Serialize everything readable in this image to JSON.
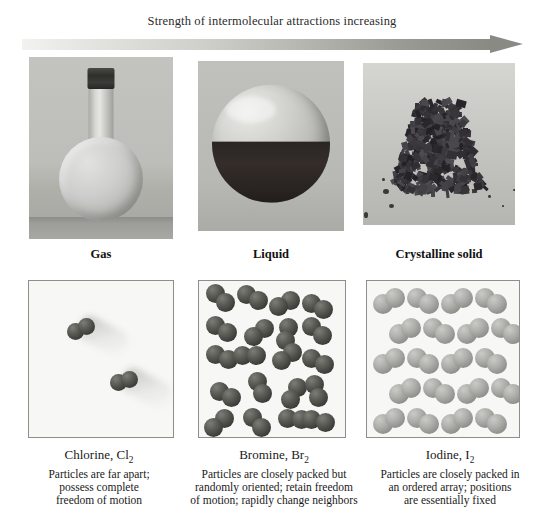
{
  "header": {
    "title": "Strength of intermolecular attractions increasing",
    "arrow": {
      "name": "gradient-arrow-right",
      "direction": "right",
      "gradient_from": "#f2f2f0",
      "gradient_to": "#8a8a85"
    }
  },
  "columns": [
    {
      "key": "gas",
      "state_label": "Gas",
      "photo_alt": "round-bottom flask with dark stopper containing pale chlorine gas",
      "substance": "Chlorine, Cl",
      "substance_sub": "2",
      "description_lines": [
        "Particles are far apart;",
        "possess complete",
        "freedom of motion"
      ],
      "molecule_color": "#3d3d39",
      "molecule_count": 2,
      "arrangement": "far apart, motion blur trails"
    },
    {
      "key": "liquid",
      "state_label": "Liquid",
      "photo_alt": "spherical flask half filled with dark red-brown liquid bromine",
      "substance": "Bromine, Br",
      "substance_sub": "2",
      "description_lines": [
        "Particles are closely packed but",
        "randomly oriented; retain freedom",
        "of motion; rapidly change neighbors"
      ],
      "molecule_color": "#3d3d39",
      "molecule_count": 20,
      "arrangement": "closely packed, random orientation"
    },
    {
      "key": "solid",
      "state_label": "Crystalline solid",
      "photo_alt": "pile of dark gray-violet iodine crystals on a light surface",
      "substance": "Iodine, I",
      "substance_sub": "2",
      "description_lines": [
        "Particles are closely packed in",
        "an ordered array; positions",
        "are essentially fixed"
      ],
      "molecule_color": "#8f8f8c",
      "molecule_count": 20,
      "arrangement": "ordered lattice array"
    }
  ],
  "chart_data": {
    "type": "diagram",
    "title": "Strength of intermolecular attractions increasing",
    "categories": [
      "Gas",
      "Liquid",
      "Crystalline solid"
    ],
    "substances": [
      "Chlorine, Cl2",
      "Bromine, Br2",
      "Iodine, I2"
    ],
    "molecule_counts": [
      2,
      20,
      20
    ],
    "ordering": "left to right = increasing intermolecular attraction"
  }
}
